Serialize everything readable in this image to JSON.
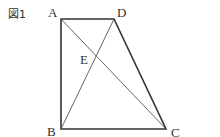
{
  "figure": {
    "caption": "図1",
    "points": {
      "A": {
        "label": "A",
        "x": 61,
        "y": 19
      },
      "D": {
        "label": "D",
        "x": 114,
        "y": 19
      },
      "B": {
        "label": "B",
        "x": 61,
        "y": 129
      },
      "C": {
        "label": "C",
        "x": 166,
        "y": 129
      },
      "E": {
        "label": "E",
        "x": 95,
        "y": 56
      }
    },
    "edges": [
      "AD",
      "DC",
      "CB",
      "BA"
    ],
    "diagonals": [
      "AC",
      "BD"
    ],
    "colors": {
      "edge": "#333333",
      "diagonal": "#555555"
    }
  }
}
